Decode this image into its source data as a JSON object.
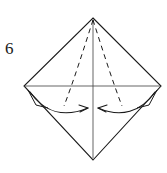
{
  "diagram": {
    "step_number": "6",
    "shape_name": "square-diamond",
    "canvas": {
      "width": 167,
      "height": 173,
      "background": "#ffffff"
    },
    "colors": {
      "outline": "#1a1a1a",
      "crease_solid": "#4a4a4a",
      "crease_dashed": "#1a1a1a",
      "arrow": "#1a1a1a",
      "background": "#ffffff"
    },
    "vertices": {
      "top": {
        "x": 93,
        "y": 18
      },
      "left": {
        "x": 24,
        "y": 86
      },
      "right": {
        "x": 161,
        "y": 86
      },
      "bottom": {
        "x": 93,
        "y": 160
      }
    },
    "outline_path": "M93,18 L161,86 L93,160 L24,86 Z",
    "creases": [
      {
        "name": "vertical-axis",
        "style": "solid",
        "label": "vertical center crease",
        "path": "M93,20 L93,158"
      },
      {
        "name": "horizontal-crease",
        "style": "solid",
        "label": "horizontal center crease",
        "path": "M25,86 L160,86"
      },
      {
        "name": "left-valley-fold",
        "style": "dashed",
        "label": "left valley fold from apex",
        "path": "M93,20 C84,48 74,80 64,106"
      },
      {
        "name": "right-valley-fold",
        "style": "dashed",
        "label": "right valley fold from apex",
        "path": "M93,20 C102,48 112,80 122,106"
      }
    ],
    "arrows": [
      {
        "name": "left-fold-arrow",
        "direction": "right",
        "label": "fold left flap toward center",
        "curve_path": "M30,92 C44,112 64,118 88,108",
        "head_path": "M88,108 L79,105 M88,108 L80,112",
        "tail_path": "M28,90 L36,105 L48,108"
      },
      {
        "name": "right-fold-arrow",
        "direction": "left",
        "label": "fold right flap toward center",
        "curve_path": "M155,92 C141,112 121,118 98,108",
        "head_path": "M98,108 L107,105 M98,108 L106,112",
        "tail_path": "M157,90 L149,105 L137,108"
      }
    ]
  }
}
